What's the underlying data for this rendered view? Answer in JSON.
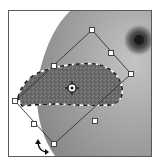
{
  "canvas": {
    "width": 162,
    "height": 165,
    "background": "#ffffff",
    "frame": {
      "x": 8,
      "y": 10,
      "w": 144,
      "h": 147,
      "border_color": "#5a5a5a"
    }
  },
  "image": {
    "subject": "sphere-with-eye",
    "sphere_color": "#9a9a9a",
    "eye_center": [
      139,
      40
    ],
    "eye_color": "#3a3a3a"
  },
  "selection": {
    "type": "lasso-selection",
    "fill": "#6e6e6e",
    "outline_style": "dashed"
  },
  "transform": {
    "mode": "free-transform-rotate",
    "handles": [
      {
        "name": "top",
        "x": 92,
        "y": 30
      },
      {
        "name": "top-right-mid",
        "x": 111,
        "y": 53
      },
      {
        "name": "right",
        "x": 131,
        "y": 74
      },
      {
        "name": "left",
        "x": 15,
        "y": 101
      },
      {
        "name": "bottom-left-mid",
        "x": 34,
        "y": 124
      },
      {
        "name": "bottom",
        "x": 54,
        "y": 144
      },
      {
        "name": "top-left-mid",
        "x": 54,
        "y": 66
      }
    ],
    "pivot": {
      "x": 72,
      "y": 88
    },
    "cursor": {
      "type": "rotate-cursor",
      "x": 40,
      "y": 148
    }
  }
}
